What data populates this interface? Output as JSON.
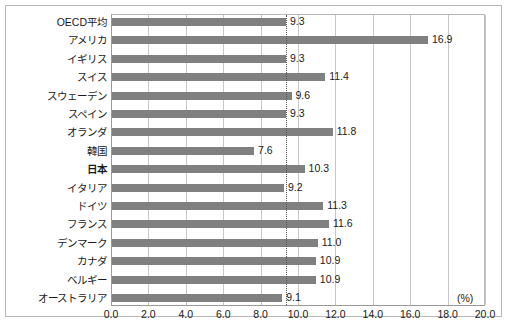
{
  "chart_data": {
    "type": "bar",
    "orientation": "horizontal",
    "title": "",
    "xlabel": "(%)",
    "ylabel": "",
    "xlim": [
      0.0,
      20.0
    ],
    "xticks": [
      "0.0",
      "2.0",
      "4.0",
      "6.0",
      "8.0",
      "10.0",
      "12.0",
      "14.0",
      "16.0",
      "18.0",
      "20.0"
    ],
    "xtick_values": [
      0,
      2,
      4,
      6,
      8,
      10,
      12,
      14,
      16,
      18,
      20
    ],
    "grid": "vertical",
    "legend": "none",
    "categories": [
      "OECD平均",
      "アメリカ",
      "イギリス",
      "スイス",
      "スウェーデン",
      "スペイン",
      "オランダ",
      "韓国",
      "日本",
      "イタリア",
      "ドイツ",
      "フランス",
      "デンマーク",
      "カナダ",
      "ベルギー",
      "オーストラリア"
    ],
    "values": [
      9.3,
      16.9,
      9.3,
      11.4,
      9.6,
      9.3,
      11.8,
      7.6,
      10.3,
      9.2,
      11.3,
      11.6,
      11.0,
      10.9,
      10.9,
      9.1
    ],
    "value_labels": [
      "9.3",
      "16.9",
      "9.3",
      "11.4",
      "9.6",
      "9.3",
      "11.8",
      "7.6",
      "10.3",
      "9.2",
      "11.3",
      "11.6",
      "11.0",
      "10.9",
      "10.9",
      "9.1"
    ],
    "emphasized_category": "日本",
    "reference_line": {
      "value": 9.3,
      "style": "dotted",
      "label": ""
    },
    "bar_color": "#808080",
    "grid_color": "#c6c6c6",
    "axis_color": "#9a9a9a",
    "reference_line_color": "#555555",
    "text_color": "#1a1a1a"
  }
}
